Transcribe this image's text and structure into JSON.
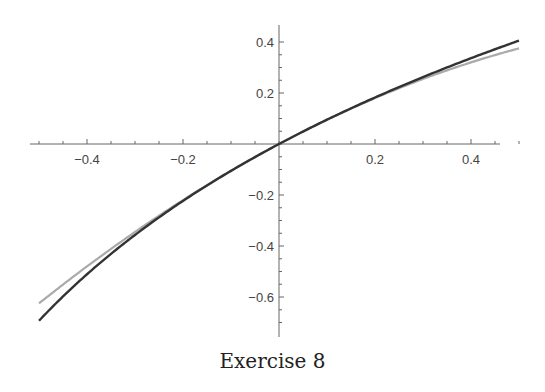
{
  "caption": "Exercise 8",
  "chart_data": {
    "type": "line",
    "title": "",
    "caption": "Exercise 8",
    "xlabel": "",
    "ylabel": "",
    "xlim": [
      -0.5,
      0.5
    ],
    "ylim": [
      -0.72,
      0.46
    ],
    "x_ticks": [
      -0.4,
      -0.2,
      0.2,
      0.4
    ],
    "y_ticks": [
      0.4,
      0.2,
      -0.2,
      -0.4,
      -0.6
    ],
    "grid": false,
    "legend": null,
    "x": [
      -0.5,
      -0.4,
      -0.3,
      -0.2,
      -0.1,
      0,
      0.1,
      0.2,
      0.3,
      0.4,
      0.5
    ],
    "series": [
      {
        "name": "ln(1+x)",
        "color": "#333333",
        "values": [
          -0.693,
          -0.511,
          -0.357,
          -0.223,
          -0.105,
          0,
          0.095,
          0.182,
          0.262,
          0.336,
          0.405
        ]
      },
      {
        "name": "x - x^2/2",
        "color": "#aaaaaa",
        "values": [
          -0.625,
          -0.48,
          -0.345,
          -0.22,
          -0.105,
          0,
          0.095,
          0.18,
          0.255,
          0.32,
          0.375
        ]
      }
    ]
  }
}
